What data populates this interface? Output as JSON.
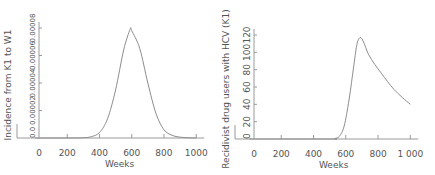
{
  "chart_data": [
    {
      "type": "line",
      "title": "",
      "xlabel": "Weeks",
      "ylabel": "Incidence from K1 to W1",
      "xlim": [
        0,
        1000
      ],
      "ylim": [
        0,
        8e-05
      ],
      "x_ticks": [
        "0",
        "200",
        "400",
        "600",
        "800",
        "1000"
      ],
      "y_ticks": [
        "0.0",
        "0.00002",
        "0.00004",
        "0.00006",
        "0.00008"
      ],
      "grid": false,
      "series": [
        {
          "name": "Incidence from K1 to W1",
          "x": [
            0,
            200,
            300,
            350,
            400,
            450,
            500,
            550,
            590,
            600,
            650,
            700,
            750,
            800,
            850,
            900,
            950,
            1000
          ],
          "values": [
            0,
            0,
            2e-07,
            1e-06,
            4e-06,
            1.4e-05,
            3.5e-05,
            6.4e-05,
            7.9e-05,
            7.8e-05,
            6.5e-05,
            4e-05,
            1.8e-05,
            6e-06,
            2e-06,
            6e-07,
            2e-07,
            0
          ]
        }
      ]
    },
    {
      "type": "line",
      "title": "",
      "xlabel": "Weeks",
      "ylabel": "Recidivist drug users with HCV (K1)",
      "xlim": [
        0,
        1000
      ],
      "ylim": [
        0,
        120
      ],
      "x_ticks": [
        "0",
        "200",
        "400",
        "600",
        "800",
        "1 000"
      ],
      "y_ticks": [
        "0",
        "20",
        "40",
        "60",
        "80",
        "100",
        "120"
      ],
      "grid": false,
      "series": [
        {
          "name": "Recidivist drug users with HCV (K1)",
          "x": [
            0,
            500,
            530,
            560,
            590,
            620,
            650,
            670,
            690,
            710,
            740,
            780,
            820,
            860,
            900,
            950,
            1000
          ],
          "values": [
            0,
            0,
            0.5,
            3,
            15,
            45,
            85,
            110,
            117,
            112,
            98,
            86,
            76,
            66,
            57,
            48,
            40
          ]
        }
      ]
    }
  ]
}
